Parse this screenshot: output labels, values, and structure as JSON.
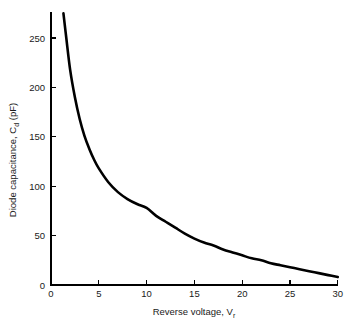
{
  "chart_data": {
    "type": "line",
    "title": "",
    "xlabel": "Reverse voltage, V",
    "xlabel_sub": "r",
    "ylabel": "Diode capacitance, C",
    "ylabel_sub": "d",
    "ylabel_unit": " (pF)",
    "xlim": [
      0,
      30
    ],
    "ylim": [
      0,
      275
    ],
    "xticks": [
      0,
      5,
      10,
      15,
      20,
      25,
      30
    ],
    "xtick_labels": [
      "0",
      "5",
      "10",
      "15",
      "20",
      "25",
      "30"
    ],
    "yticks": [
      0,
      50,
      100,
      150,
      200,
      250
    ],
    "ytick_labels": [
      "0",
      "50",
      "100",
      "150",
      "200",
      "250"
    ],
    "grid": false,
    "legend": "none",
    "series": [
      {
        "name": "Diode capacitance vs reverse voltage",
        "color": "#000000",
        "x": [
          1.3,
          1.6,
          2.0,
          2.5,
          3.0,
          3.5,
          4.0,
          4.5,
          5.0,
          6.0,
          7.0,
          8.0,
          9.0,
          10.0,
          11.0,
          12.0,
          13.0,
          14.0,
          15.0,
          16.0,
          17.0,
          18.0,
          19.0,
          20.0,
          21.0,
          22.0,
          23.0,
          24.0,
          25.0,
          26.0,
          27.0,
          28.0,
          29.0,
          30.0
        ],
        "y": [
          275,
          250,
          218,
          190,
          168,
          151,
          138,
          127,
          118,
          104,
          94,
          87,
          82,
          78,
          70,
          64,
          58,
          52,
          47,
          43,
          40,
          36,
          33,
          30,
          27,
          25,
          22,
          20,
          18,
          16,
          14,
          12,
          10,
          8
        ]
      }
    ]
  },
  "axis_labels": {
    "x_main": "Reverse voltage, V",
    "x_sub": "r",
    "y_main": "Diode capacitance, C",
    "y_sub": "d",
    "y_unit": " (pF)"
  }
}
